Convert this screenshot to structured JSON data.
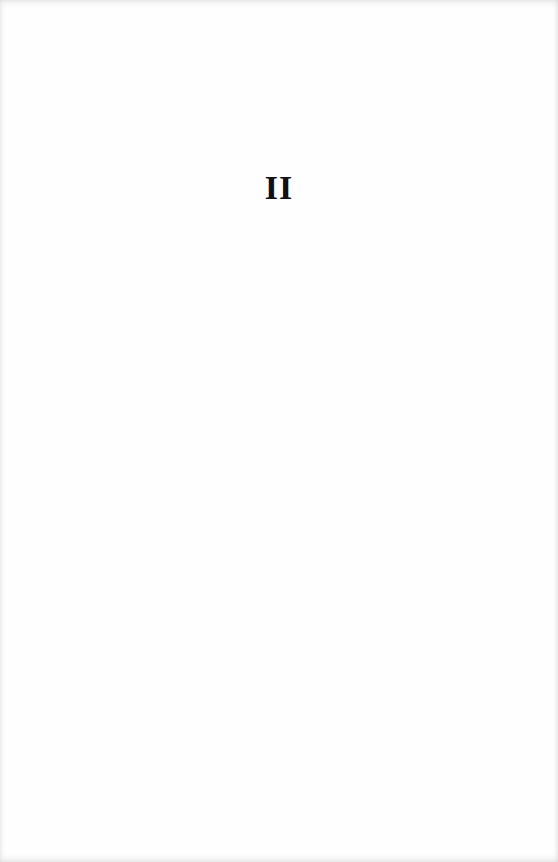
{
  "page": {
    "chapter_number": "II"
  }
}
